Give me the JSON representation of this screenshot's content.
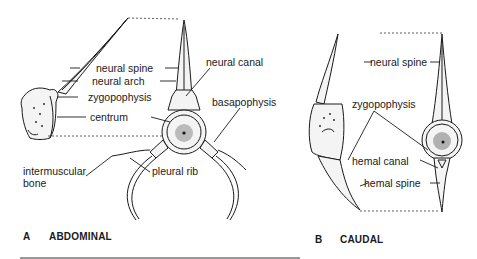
{
  "figure": {
    "panel_a": {
      "letter": "A",
      "title": "ABDOMINAL",
      "labels": {
        "neural_spine": "neural spine",
        "neural_arch": "neural arch",
        "zygopophysis": "zygopophysis",
        "centrum": "centrum",
        "neural_canal": "neural canal",
        "basapophysis": "basapophysis",
        "intermuscular_bone_line1": "intermuscular",
        "intermuscular_bone_line2": "bone",
        "pleural_rib": "pleural rib"
      }
    },
    "panel_b": {
      "letter": "B",
      "title": "CAUDAL",
      "labels": {
        "neural_spine": "neural spine",
        "zygopophysis": "zygopophysis",
        "hemal_canal": "hemal canal",
        "hemal_spine": "hemal spine"
      }
    }
  }
}
